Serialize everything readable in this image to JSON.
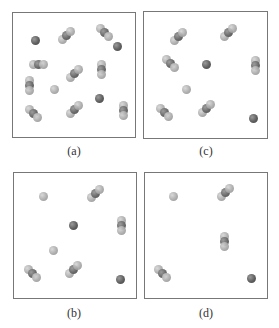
{
  "figure": {
    "panels": [
      {
        "id": "a",
        "label": "(a)",
        "frame": {
          "x": 12,
          "y": 12,
          "w": 124,
          "h": 126
        },
        "label_pos": {
          "x": 54,
          "y": 144
        },
        "molecules": [
          {
            "type": "single-dark",
            "x": 22,
            "y": 27
          },
          {
            "type": "trimer-up-right",
            "x": 53,
            "y": 22
          },
          {
            "type": "trimer-down-right",
            "x": 91,
            "y": 19
          },
          {
            "type": "single-dark",
            "x": 104,
            "y": 33
          },
          {
            "type": "trimer-horizontal",
            "x": 25,
            "y": 51
          },
          {
            "type": "trimer-up-right",
            "x": 61,
            "y": 60
          },
          {
            "type": "trimer-vertical",
            "x": 88,
            "y": 56
          },
          {
            "type": "trimer-vertical",
            "x": 16,
            "y": 72
          },
          {
            "type": "single-light",
            "x": 41,
            "y": 76
          },
          {
            "type": "single-dark",
            "x": 86,
            "y": 85
          },
          {
            "type": "trimer-down-right",
            "x": 20,
            "y": 100
          },
          {
            "type": "trimer-up-right",
            "x": 61,
            "y": 96
          },
          {
            "type": "trimer-vertical",
            "x": 110,
            "y": 97
          }
        ]
      },
      {
        "id": "c",
        "label": "(c)",
        "frame": {
          "x": 143,
          "y": 11,
          "w": 125,
          "h": 128
        },
        "label_pos": {
          "x": 186,
          "y": 144
        },
        "molecules": [
          {
            "type": "trimer-up-right",
            "x": 34,
            "y": 24
          },
          {
            "type": "trimer-up-right",
            "x": 84,
            "y": 20
          },
          {
            "type": "trimer-down-right",
            "x": 26,
            "y": 51
          },
          {
            "type": "single-dark",
            "x": 62,
            "y": 52
          },
          {
            "type": "trimer-vertical",
            "x": 111,
            "y": 53
          },
          {
            "type": "single-light",
            "x": 42,
            "y": 77
          },
          {
            "type": "trimer-down-right",
            "x": 20,
            "y": 100
          },
          {
            "type": "trimer-up-right",
            "x": 62,
            "y": 96
          },
          {
            "type": "single-dark",
            "x": 109,
            "y": 106
          }
        ]
      },
      {
        "id": "b",
        "label": "(b)",
        "frame": {
          "x": 13,
          "y": 172,
          "w": 124,
          "h": 127
        },
        "label_pos": {
          "x": 54,
          "y": 306
        },
        "molecules": [
          {
            "type": "single-light",
            "x": 29,
            "y": 23
          },
          {
            "type": "trimer-up-right",
            "x": 81,
            "y": 20
          },
          {
            "type": "single-dark",
            "x": 59,
            "y": 52
          },
          {
            "type": "trimer-vertical",
            "x": 107,
            "y": 52
          },
          {
            "type": "single-light",
            "x": 39,
            "y": 77
          },
          {
            "type": "trimer-down-right",
            "x": 18,
            "y": 100
          },
          {
            "type": "trimer-up-right",
            "x": 59,
            "y": 96
          },
          {
            "type": "single-dark",
            "x": 106,
            "y": 106
          }
        ]
      },
      {
        "id": "d",
        "label": "(d)",
        "frame": {
          "x": 144,
          "y": 172,
          "w": 124,
          "h": 127
        },
        "label_pos": {
          "x": 186,
          "y": 306
        },
        "molecules": [
          {
            "type": "single-light",
            "x": 28,
            "y": 23
          },
          {
            "type": "trimer-up-right",
            "x": 80,
            "y": 19
          },
          {
            "type": "trimer-vertical",
            "x": 79,
            "y": 68
          },
          {
            "type": "trimer-down-right",
            "x": 17,
            "y": 100
          },
          {
            "type": "single-dark",
            "x": 106,
            "y": 105
          }
        ]
      }
    ]
  }
}
